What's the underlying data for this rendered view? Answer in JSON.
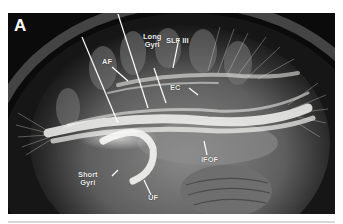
{
  "figure": {
    "panel_letter": "A",
    "labels": {
      "af": "AF",
      "long_gyri": "Long\nGyri",
      "slf3": "SLF III",
      "ec": "EC",
      "ifof": "IFOF",
      "short_gyri": "Short\nGyri",
      "uf": "UF"
    },
    "colors": {
      "background": "#0b0b0b",
      "fiber": "#f4f4f2",
      "label": "#f2f2f2",
      "page": "#ffffff"
    }
  }
}
